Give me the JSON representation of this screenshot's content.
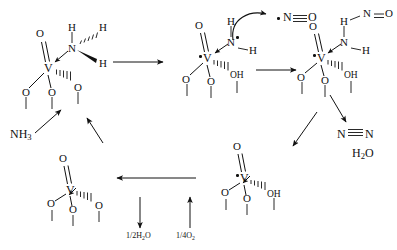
{
  "diagram": {
    "type": "chemical-reaction-mechanism",
    "width": 397,
    "height": 250,
    "background": "#ffffff",
    "ink": "#111111"
  },
  "atoms": {
    "O": "O",
    "V": "V",
    "N": "N",
    "H": "H",
    "OH": "OH"
  },
  "species": {
    "ammonia": "NH",
    "ammonia_sub": "3",
    "nitric_oxide_radical": "N",
    "nitric_oxide_O": "O",
    "dinitrogen_left": "N",
    "dinitrogen_right": "N",
    "water_H": "H",
    "water_sub": "2",
    "water_O": "O"
  },
  "reagent_labels": {
    "half_water": "1/2H",
    "half_water_sub": "2",
    "half_water_tail": "O",
    "quarter_oxygen": "1/4O",
    "quarter_oxygen_sub": "2"
  },
  "structures": [
    {
      "id": "complex-1",
      "name": "ammonia-adsorbed-vanadyl-complex",
      "position": "top-left",
      "center_atom": "V",
      "ligands": [
        "=O",
        "-O-",
        "-O-",
        "-O-",
        "NH3"
      ],
      "labels": {
        "oxo": "O",
        "metal": "V",
        "nitrogen": "N",
        "h_top": "H",
        "h_hashed": "H",
        "h_wedge": "H",
        "o_left": "O",
        "o_mid": "O",
        "o_right": "O"
      }
    },
    {
      "id": "complex-2",
      "name": "amide-radical-vanadium-hydroxide-complex",
      "position": "top-center",
      "center_atom": "V",
      "radical_on": "V",
      "labels": {
        "oxo": "O",
        "metal": "V",
        "nitrogen": "N",
        "h_top": "H",
        "h_right": "H",
        "o_left": "O",
        "o_mid": "O",
        "hydroxyl": "OH"
      }
    },
    {
      "id": "complex-3",
      "name": "nitrosamide-intermediate-complex",
      "position": "top-right",
      "center_atom": "V",
      "radical_on": "V",
      "labels": {
        "oxo": "O",
        "metal": "V",
        "nitrogen_amine": "N",
        "h_top": "H",
        "h_right": "H",
        "nitroso_N": "N",
        "nitroso_O": "O",
        "o_left": "O",
        "o_mid": "O",
        "hydroxyl": "OH"
      }
    },
    {
      "id": "complex-4",
      "name": "reduced-vanadium-hydroxide-complex",
      "position": "bottom-center",
      "center_atom": "V",
      "radical_on": "V",
      "labels": {
        "oxo": "O",
        "metal": "V",
        "o_left": "O",
        "o_mid": "O",
        "hydroxyl": "OH"
      }
    },
    {
      "id": "complex-5",
      "name": "regenerated-vanadyl-catalyst",
      "position": "bottom-left",
      "center_atom": "V",
      "labels": {
        "oxo": "O",
        "metal": "V",
        "o_left": "O",
        "o_mid": "O",
        "o_right": "O"
      }
    }
  ],
  "arrows": [
    {
      "id": "a1",
      "name": "arrow-complex1-to-complex2",
      "kind": "reaction"
    },
    {
      "id": "a2",
      "name": "arrow-complex2-to-complex3",
      "kind": "reaction"
    },
    {
      "id": "a3",
      "name": "arrow-complex3-to-products",
      "kind": "reaction"
    },
    {
      "id": "a4",
      "name": "arrow-complex3-to-complex4",
      "kind": "reaction"
    },
    {
      "id": "a5",
      "name": "arrow-complex4-to-complex5",
      "kind": "reaction"
    },
    {
      "id": "a6",
      "name": "arrow-nh3-to-complex1",
      "kind": "reagent-in"
    },
    {
      "id": "a7",
      "name": "arrow-catalyst-regeneration",
      "kind": "reagent-in"
    },
    {
      "id": "a8",
      "name": "arrow-water-release",
      "kind": "reagent-out"
    },
    {
      "id": "a9",
      "name": "arrow-oxygen-uptake",
      "kind": "reagent-in"
    },
    {
      "id": "a10",
      "name": "curved-arrow-h-abstraction",
      "kind": "electron-transfer"
    }
  ]
}
